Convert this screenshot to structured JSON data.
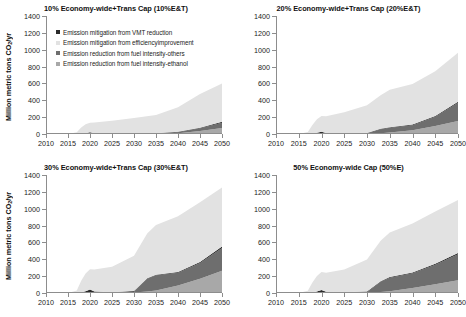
{
  "figure": {
    "yaxis_title_main": "Million metric tons CO",
    "yaxis_title_sub": "2",
    "yaxis_title_tail": "/yr"
  },
  "legend": {
    "items": [
      {
        "label": "Emission mitigation from VMT reduction",
        "color": "#2b2b2b",
        "name": "legend-vmt-reduction"
      },
      {
        "label": "Emission mitigation from efficiencyimprovement",
        "color": "#e2e2e2",
        "name": "legend-efficiency-improvement"
      },
      {
        "label": "Emission reduction from fuel intensity-others",
        "color": "#6e6e6e",
        "name": "legend-fuel-intensity-others"
      },
      {
        "label": "Emission reduction from fuel intensity-ethanol",
        "color": "#a8a8a8",
        "name": "legend-fuel-intensity-ethanol"
      }
    ]
  },
  "chart_data": [
    {
      "type": "area",
      "panel_id": "panel-10ET",
      "title": "10% Economy-wide+Trans Cap (10%E&T)",
      "xlabel": "",
      "ylabel": "Million metric tons CO2/yr",
      "ylim": [
        0,
        1400
      ],
      "xlim": [
        2010,
        2050
      ],
      "yticks": [
        0,
        200,
        400,
        600,
        800,
        1000,
        1200,
        1400
      ],
      "xticks": [
        2010,
        2015,
        2020,
        2025,
        2030,
        2035,
        2040,
        2045,
        2050
      ],
      "grid": false,
      "legend_position": "inside-top-left",
      "x": [
        2010,
        2015,
        2017,
        2018,
        2019,
        2020,
        2021,
        2025,
        2030,
        2035,
        2040,
        2045,
        2050
      ],
      "series": [
        {
          "name": "Emission reduction from fuel intensity-ethanol",
          "values": [
            0,
            0,
            0,
            0,
            0,
            0,
            0,
            0,
            0,
            2,
            10,
            35,
            70
          ]
        },
        {
          "name": "Emission reduction from fuel intensity-others",
          "values": [
            0,
            0,
            0,
            0,
            0,
            0,
            0,
            0,
            0,
            2,
            12,
            32,
            62
          ]
        },
        {
          "name": "Emission mitigation from VMT reduction",
          "values": [
            0,
            0,
            0,
            2,
            10,
            22,
            10,
            6,
            5,
            5,
            5,
            8,
            12
          ]
        },
        {
          "name": "Emission mitigation from efficiencyimprovement",
          "values": [
            0,
            0,
            20,
            75,
            105,
            110,
            125,
            150,
            185,
            215,
            290,
            400,
            455
          ]
        }
      ],
      "totals": [
        0,
        0,
        20,
        77,
        115,
        132,
        135,
        156,
        190,
        224,
        317,
        475,
        599
      ]
    },
    {
      "type": "area",
      "panel_id": "panel-20ET",
      "title": "20% Economy-wide+Trans Cap (20%E&T)",
      "xlabel": "",
      "ylabel": "Million metric tons CO2/yr",
      "ylim": [
        0,
        1400
      ],
      "xlim": [
        2010,
        2050
      ],
      "yticks": [
        0,
        200,
        400,
        600,
        800,
        1000,
        1200,
        1400
      ],
      "xticks": [
        2010,
        2015,
        2020,
        2025,
        2030,
        2035,
        2040,
        2045,
        2050
      ],
      "grid": false,
      "legend_position": "none",
      "x": [
        2010,
        2015,
        2017,
        2018,
        2019,
        2020,
        2021,
        2025,
        2030,
        2033,
        2035,
        2040,
        2045,
        2050
      ],
      "series": [
        {
          "name": "Emission reduction from fuel intensity-ethanol",
          "values": [
            0,
            0,
            0,
            0,
            0,
            0,
            0,
            0,
            2,
            10,
            18,
            45,
            95,
            155
          ]
        },
        {
          "name": "Emission reduction from fuel intensity-others",
          "values": [
            0,
            0,
            0,
            0,
            0,
            0,
            0,
            0,
            3,
            45,
            55,
            60,
            110,
            215
          ]
        },
        {
          "name": "Emission mitigation from VMT reduction",
          "values": [
            0,
            0,
            0,
            3,
            14,
            28,
            12,
            8,
            6,
            6,
            6,
            8,
            10,
            14
          ]
        },
        {
          "name": "Emission mitigation from efficiencyimprovement",
          "values": [
            0,
            0,
            25,
            105,
            160,
            185,
            200,
            250,
            330,
            400,
            445,
            480,
            530,
            580
          ]
        }
      ],
      "totals": [
        0,
        0,
        25,
        108,
        174,
        213,
        212,
        258,
        341,
        461,
        524,
        593,
        745,
        964
      ]
    },
    {
      "type": "area",
      "panel_id": "panel-30ET",
      "title": "30% Economy-wide+Trans Cap (30%E&T)",
      "xlabel": "",
      "ylabel": "Million metric tons CO2/yr",
      "ylim": [
        0,
        1400
      ],
      "xlim": [
        2010,
        2050
      ],
      "yticks": [
        0,
        200,
        400,
        600,
        800,
        1000,
        1200,
        1400
      ],
      "xticks": [
        2010,
        2015,
        2020,
        2025,
        2030,
        2035,
        2040,
        2045,
        2050
      ],
      "grid": false,
      "legend_position": "none",
      "x": [
        2010,
        2015,
        2017,
        2018,
        2019,
        2020,
        2021,
        2025,
        2030,
        2033,
        2035,
        2040,
        2045,
        2050
      ],
      "series": [
        {
          "name": "Emission reduction from fuel intensity-ethanol",
          "values": [
            0,
            0,
            0,
            0,
            0,
            0,
            0,
            0,
            5,
            18,
            30,
            90,
            170,
            265
          ]
        },
        {
          "name": "Emission reduction from fuel intensity-others",
          "values": [
            0,
            0,
            0,
            0,
            0,
            0,
            0,
            0,
            10,
            150,
            180,
            150,
            185,
            270
          ]
        },
        {
          "name": "Emission mitigation from VMT reduction",
          "values": [
            0,
            0,
            0,
            5,
            22,
            42,
            18,
            10,
            8,
            8,
            8,
            10,
            12,
            16
          ]
        },
        {
          "name": "Emission mitigation from efficiencyimprovement",
          "values": [
            0,
            0,
            30,
            140,
            210,
            240,
            260,
            300,
            420,
            530,
            590,
            660,
            710,
            700
          ]
        }
      ],
      "totals": [
        0,
        0,
        30,
        145,
        232,
        282,
        278,
        310,
        443,
        706,
        808,
        910,
        1077,
        1251
      ]
    },
    {
      "type": "area",
      "panel_id": "panel-50E",
      "title": "50% Economy-wide Cap (50%E)",
      "xlabel": "",
      "ylabel": "Million metric tons CO2/yr",
      "ylim": [
        0,
        1400
      ],
      "xlim": [
        2010,
        2050
      ],
      "yticks": [
        0,
        200,
        400,
        600,
        800,
        1000,
        1200,
        1400
      ],
      "xticks": [
        2010,
        2015,
        2020,
        2025,
        2030,
        2035,
        2040,
        2045,
        2050
      ],
      "grid": false,
      "legend_position": "none",
      "x": [
        2010,
        2015,
        2017,
        2018,
        2019,
        2020,
        2021,
        2025,
        2030,
        2033,
        2035,
        2040,
        2045,
        2050
      ],
      "series": [
        {
          "name": "Emission reduction from fuel intensity-ethanol",
          "values": [
            0,
            0,
            0,
            0,
            0,
            0,
            0,
            0,
            2,
            12,
            22,
            60,
            105,
            150
          ]
        },
        {
          "name": "Emission reduction from fuel intensity-others",
          "values": [
            0,
            0,
            0,
            0,
            0,
            0,
            0,
            0,
            8,
            120,
            160,
            175,
            230,
            310
          ]
        },
        {
          "name": "Emission mitigation from VMT reduction",
          "values": [
            0,
            0,
            0,
            4,
            18,
            35,
            15,
            9,
            7,
            7,
            7,
            9,
            11,
            14
          ]
        },
        {
          "name": "Emission mitigation from efficiencyimprovement",
          "values": [
            0,
            0,
            28,
            120,
            185,
            215,
            225,
            270,
            380,
            480,
            530,
            580,
            620,
            630
          ]
        }
      ],
      "totals": [
        0,
        0,
        28,
        124,
        203,
        250,
        240,
        279,
        397,
        619,
        719,
        824,
        966,
        1104
      ]
    }
  ]
}
